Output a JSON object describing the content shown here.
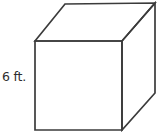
{
  "figure": {
    "type": "geometric-solid",
    "shape_name": "cube",
    "projection": "oblique",
    "background_color": "#ffffff",
    "line_color": "#3b3b3b",
    "face_color": "#ffffff",
    "line_width": 1.7
  },
  "labels": {
    "edge_length": "6 ft.",
    "value": 6,
    "unit": "ft."
  },
  "geometry": {
    "front_face": "35,41 122,41 122,130 35,130",
    "top_face": "35,41 65,4 155,3 122,41",
    "right_face": "122,41 155,3 155,93 122,130",
    "front_top_left": "35,41",
    "front_top_right": "122,41",
    "front_bottom_right": "122,130",
    "front_bottom_left": "35,130",
    "back_top_left": "65,4",
    "back_top_right": "155,3",
    "back_bottom_right": "155,93"
  }
}
